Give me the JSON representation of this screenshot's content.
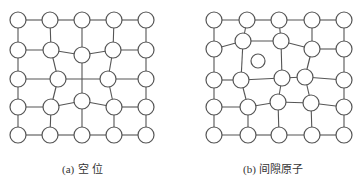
{
  "figure": {
    "panels": [
      {
        "id": "a",
        "label": "(a)",
        "caption_text": "空  位",
        "defect": "vacancy",
        "atom_radius": 8,
        "atoms": [
          [
            18,
            20
          ],
          [
            50,
            20
          ],
          [
            82,
            20
          ],
          [
            114,
            20
          ],
          [
            146,
            20
          ],
          [
            18,
            50
          ],
          [
            51,
            50
          ],
          [
            82,
            55
          ],
          [
            113,
            50
          ],
          [
            146,
            50
          ],
          [
            18,
            79
          ],
          [
            58,
            79
          ],
          [
            108,
            79
          ],
          [
            146,
            79
          ],
          [
            18,
            107
          ],
          [
            51,
            107
          ],
          [
            82,
            101
          ],
          [
            114,
            107
          ],
          [
            146,
            107
          ],
          [
            18,
            135
          ],
          [
            50,
            135
          ],
          [
            82,
            135
          ],
          [
            114,
            135
          ],
          [
            146,
            135
          ]
        ],
        "bonds": [
          [
            0,
            1
          ],
          [
            1,
            2
          ],
          [
            2,
            3
          ],
          [
            3,
            4
          ],
          [
            0,
            5
          ],
          [
            1,
            6
          ],
          [
            2,
            7
          ],
          [
            3,
            8
          ],
          [
            4,
            9
          ],
          [
            5,
            6
          ],
          [
            6,
            7
          ],
          [
            7,
            8
          ],
          [
            8,
            9
          ],
          [
            5,
            10
          ],
          [
            6,
            11
          ],
          [
            8,
            12
          ],
          [
            9,
            13
          ],
          [
            10,
            11
          ],
          [
            12,
            13
          ],
          [
            10,
            14
          ],
          [
            11,
            15
          ],
          [
            12,
            17
          ],
          [
            13,
            18
          ],
          [
            14,
            15
          ],
          [
            15,
            16
          ],
          [
            16,
            17
          ],
          [
            17,
            18
          ],
          [
            14,
            19
          ],
          [
            15,
            20
          ],
          [
            16,
            21
          ],
          [
            17,
            22
          ],
          [
            18,
            23
          ],
          [
            19,
            20
          ],
          [
            20,
            21
          ],
          [
            21,
            22
          ],
          [
            22,
            23
          ]
        ],
        "extra_lines": [
          [
            [
              58,
              79
            ],
            [
              108,
              79
            ]
          ],
          [
            [
              82,
              55
            ],
            [
              82,
              101
            ]
          ]
        ],
        "caption_pos": [
          62,
          160
        ]
      },
      {
        "id": "b",
        "label": "(b)",
        "caption_text": "间隙原子",
        "defect": "interstitial",
        "atom_radius": 8,
        "atoms": [
          [
            214,
            20
          ],
          [
            247,
            20
          ],
          [
            279,
            20
          ],
          [
            312,
            20
          ],
          [
            344,
            20
          ],
          [
            214,
            49
          ],
          [
            243,
            41
          ],
          [
            281,
            41
          ],
          [
            312,
            49
          ],
          [
            344,
            49
          ],
          [
            214,
            80
          ],
          [
            241,
            80
          ],
          [
            282,
            78
          ],
          [
            305,
            77
          ],
          [
            344,
            80
          ],
          [
            214,
            107
          ],
          [
            248,
            107
          ],
          [
            278,
            102
          ],
          [
            311,
            103
          ],
          [
            344,
            107
          ],
          [
            214,
            135
          ],
          [
            248,
            135
          ],
          [
            279,
            135
          ],
          [
            312,
            135
          ],
          [
            344,
            135
          ]
        ],
        "interstitial": {
          "cx": 258,
          "cy": 61,
          "r": 7
        },
        "bonds": [
          [
            0,
            1
          ],
          [
            1,
            2
          ],
          [
            2,
            3
          ],
          [
            3,
            4
          ],
          [
            0,
            5
          ],
          [
            1,
            6
          ],
          [
            2,
            7
          ],
          [
            3,
            8
          ],
          [
            4,
            9
          ],
          [
            5,
            6
          ],
          [
            6,
            7
          ],
          [
            7,
            8
          ],
          [
            8,
            9
          ],
          [
            5,
            10
          ],
          [
            6,
            11
          ],
          [
            7,
            12
          ],
          [
            8,
            13
          ],
          [
            9,
            14
          ],
          [
            10,
            11
          ],
          [
            11,
            12
          ],
          [
            12,
            13
          ],
          [
            13,
            14
          ],
          [
            10,
            15
          ],
          [
            11,
            16
          ],
          [
            12,
            17
          ],
          [
            13,
            18
          ],
          [
            14,
            19
          ],
          [
            15,
            16
          ],
          [
            16,
            17
          ],
          [
            17,
            18
          ],
          [
            18,
            19
          ],
          [
            15,
            20
          ],
          [
            16,
            21
          ],
          [
            17,
            22
          ],
          [
            18,
            23
          ],
          [
            19,
            24
          ],
          [
            20,
            21
          ],
          [
            21,
            22
          ],
          [
            22,
            23
          ],
          [
            23,
            24
          ]
        ],
        "extra_lines": [],
        "caption_pos": [
          243,
          160
        ]
      }
    ],
    "colors": {
      "stroke": "#555555",
      "atom_fill": "#ffffff",
      "caption": "#333333"
    }
  }
}
